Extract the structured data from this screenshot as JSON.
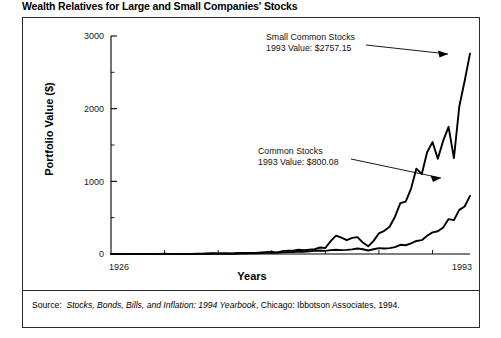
{
  "figure": {
    "title": "Wealth Relatives for Large and Small Companies' Stocks",
    "source_prefix": "Source:",
    "source_italic": "Stocks, Bonds, Bills, and Inflation: 1994 Yearbook",
    "source_tail": ", Chicago: Ibbotson Associates, 1994."
  },
  "chart_data": {
    "type": "line",
    "title": "Wealth Relatives for Large and Small Companies' Stocks",
    "xlabel": "Years",
    "ylabel": "Portfolio Value ($)",
    "xlim": [
      1926,
      1993
    ],
    "ylim": [
      0,
      3000
    ],
    "xticks": [
      1926,
      1993
    ],
    "xtick_labels": [
      "1926",
      "1993"
    ],
    "xticks_minor": [
      1936,
      1946,
      1956,
      1966,
      1976,
      1986
    ],
    "yticks": [
      0,
      1000,
      2000,
      3000
    ],
    "ytick_labels": [
      "0",
      "1000",
      "2000",
      "3000"
    ],
    "yticks_minor": [
      500,
      1500,
      2500
    ],
    "grid": false,
    "legend": "annotations",
    "line_color": "#000000",
    "x": [
      1926,
      1927,
      1928,
      1929,
      1930,
      1931,
      1932,
      1933,
      1934,
      1935,
      1936,
      1937,
      1938,
      1939,
      1940,
      1941,
      1942,
      1943,
      1944,
      1945,
      1946,
      1947,
      1948,
      1949,
      1950,
      1951,
      1952,
      1953,
      1954,
      1955,
      1956,
      1957,
      1958,
      1959,
      1960,
      1961,
      1962,
      1963,
      1964,
      1965,
      1966,
      1967,
      1968,
      1969,
      1970,
      1971,
      1972,
      1973,
      1974,
      1975,
      1976,
      1977,
      1978,
      1979,
      1980,
      1981,
      1982,
      1983,
      1984,
      1985,
      1986,
      1987,
      1988,
      1989,
      1990,
      1991,
      1992,
      1993
    ],
    "series": [
      {
        "name": "Small Common Stocks",
        "label_line1": "Small Common Stocks",
        "label_line2": "1993 Value: $2757.15",
        "final_value": 2757.15,
        "values": [
          1.0,
          1.22,
          1.85,
          1.0,
          0.55,
          0.29,
          0.31,
          0.93,
          1.15,
          1.78,
          2.97,
          1.45,
          2.02,
          2.07,
          1.98,
          1.83,
          2.42,
          4.65,
          7.04,
          10.0,
          9.2,
          9.4,
          8.9,
          10.3,
          13.6,
          15.3,
          15.8,
          14.2,
          22.2,
          25.6,
          27.0,
          22.1,
          39.9,
          46.7,
          44.1,
          59.1,
          52.5,
          58.2,
          65.2,
          89.3,
          83.0,
          176.0,
          253.0,
          225.0,
          190.0,
          222.0,
          232.0,
          157.0,
          106.0,
          181.0,
          284.0,
          319.0,
          374.0,
          513.0,
          700.0,
          721.0,
          900.0,
          1175.0,
          1100.0,
          1400.0,
          1540.0,
          1310.0,
          1560.0,
          1750.0,
          1320.0,
          2030.0,
          2380.0,
          2757.15
        ]
      },
      {
        "name": "Common Stocks",
        "label_line1": "Common Stocks",
        "label_line2": "1993 Value: $800.08",
        "final_value": 800.08,
        "values": [
          1.0,
          1.37,
          1.96,
          1.8,
          1.36,
          0.77,
          0.71,
          1.09,
          1.08,
          1.59,
          2.13,
          1.38,
          1.81,
          1.8,
          1.62,
          1.44,
          1.73,
          2.18,
          2.61,
          3.56,
          3.27,
          3.46,
          3.65,
          4.34,
          5.71,
          7.08,
          8.38,
          8.3,
          12.67,
          16.66,
          17.76,
          15.85,
          22.73,
          25.45,
          25.57,
          32.46,
          29.63,
          36.38,
          42.38,
          47.67,
          42.88,
          53.15,
          59.0,
          54.0,
          56.1,
          64.1,
          76.3,
          65.1,
          47.9,
          65.7,
          81.4,
          75.6,
          80.5,
          95.4,
          126.4,
          120.2,
          146.0,
          179.0,
          190.3,
          250.8,
          297.5,
          313.1,
          364.9,
          480.4,
          465.5,
          607.3,
          653.7,
          800.08
        ]
      }
    ],
    "annotations": [
      {
        "target_series": "Small Common Stocks",
        "text_line1": "Small Common Stocks",
        "text_line2": "1993 Value: $2757.15",
        "arrow": "points-right-to-peak"
      },
      {
        "target_series": "Common Stocks",
        "text_line1": "Common Stocks",
        "text_line2": "1993 Value: $800.08",
        "arrow": "points-right-down-to-curve"
      }
    ]
  }
}
